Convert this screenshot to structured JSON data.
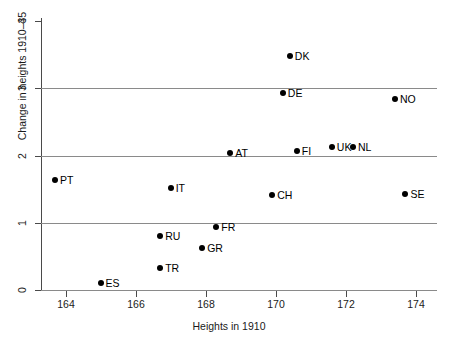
{
  "chart_data": {
    "type": "scatter",
    "title": "",
    "xlabel": "Heights in 1910",
    "ylabel": "Change in heights 1910–35",
    "xlim": [
      163.3,
      174.6
    ],
    "ylim": [
      0,
      4
    ],
    "xticks": [
      "164",
      "166",
      "168",
      "170",
      "172",
      "174"
    ],
    "xtick_values": [
      164,
      166,
      168,
      170,
      172,
      174
    ],
    "yticks": [
      "0",
      "1",
      "2",
      "3",
      "4"
    ],
    "ytick_values": [
      0,
      1,
      2,
      3,
      4
    ],
    "grid": "horizontal gridlines at y = 0, 1, 2, 3",
    "gridline_values": [
      0,
      1,
      2,
      3
    ],
    "legend": "none",
    "marker": "filled black circle",
    "point_color": "#000000",
    "grid_color": "#8a8a8a",
    "axis_color": "#4a4a4a",
    "points": [
      {
        "label": "PT",
        "x": 163.7,
        "y": 1.63,
        "label_side": "right"
      },
      {
        "label": "ES",
        "x": 165.0,
        "y": 0.1,
        "label_side": "right"
      },
      {
        "label": "TR",
        "x": 166.7,
        "y": 0.33,
        "label_side": "right"
      },
      {
        "label": "RU",
        "x": 166.7,
        "y": 0.81,
        "label_side": "right"
      },
      {
        "label": "IT",
        "x": 167.0,
        "y": 1.52,
        "label_side": "right"
      },
      {
        "label": "GR",
        "x": 167.9,
        "y": 0.63,
        "label_side": "right"
      },
      {
        "label": "FR",
        "x": 168.3,
        "y": 0.93,
        "label_side": "right"
      },
      {
        "label": "AT",
        "x": 168.7,
        "y": 2.04,
        "label_side": "right"
      },
      {
        "label": "CH",
        "x": 169.9,
        "y": 1.42,
        "label_side": "right"
      },
      {
        "label": "DE",
        "x": 170.2,
        "y": 2.93,
        "label_side": "right"
      },
      {
        "label": "DK",
        "x": 170.4,
        "y": 3.48,
        "label_side": "right"
      },
      {
        "label": "FI",
        "x": 170.6,
        "y": 2.06,
        "label_side": "right"
      },
      {
        "label": "UK",
        "x": 171.6,
        "y": 2.13,
        "label_side": "right"
      },
      {
        "label": "NL",
        "x": 172.2,
        "y": 2.13,
        "label_side": "right"
      },
      {
        "label": "NO",
        "x": 173.4,
        "y": 2.84,
        "label_side": "right"
      },
      {
        "label": "SE",
        "x": 173.7,
        "y": 1.43,
        "label_side": "right"
      }
    ]
  }
}
